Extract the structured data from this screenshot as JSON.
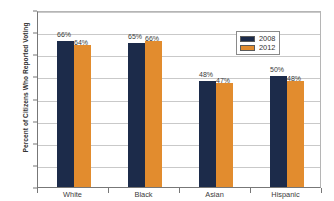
{
  "chart_data": {
    "type": "bar",
    "title": "",
    "subtitle": "",
    "xlabel": "",
    "ylabel": "Percent of Citizens Who Reported Voting",
    "ylim": [
      0,
      80
    ],
    "yticks": [
      0,
      10,
      20,
      30,
      40,
      50,
      60,
      70,
      80
    ],
    "ytick_labels": [
      "0",
      "10",
      "20",
      "30",
      "40",
      "50",
      "60",
      "70",
      "80"
    ],
    "grid": true,
    "legend_position": "upper-right",
    "categories": [
      "White",
      "Black",
      "Asian",
      "Hispanic"
    ],
    "series": [
      {
        "name": "2008",
        "color": "#1c2b4a",
        "values": [
          66,
          65,
          48,
          50
        ],
        "data_labels": [
          "66%",
          "65%",
          "48%",
          "50%"
        ]
      },
      {
        "name": "2012",
        "color": "#e28c2e",
        "values": [
          64,
          66,
          47,
          48
        ],
        "data_labels": [
          "64%",
          "66%",
          "47%",
          "48%"
        ]
      }
    ]
  },
  "legend": {
    "entries": [
      {
        "label": "2008",
        "color": "#1c2b4a"
      },
      {
        "label": "2012",
        "color": "#e28c2e"
      }
    ]
  },
  "colors": {
    "series_2008": "#1c2b4a",
    "series_2012": "#e28c2e",
    "gridline": "#c9c9c9",
    "axis": "#777777",
    "text": "#3a3a3a",
    "background": "#ffffff"
  }
}
